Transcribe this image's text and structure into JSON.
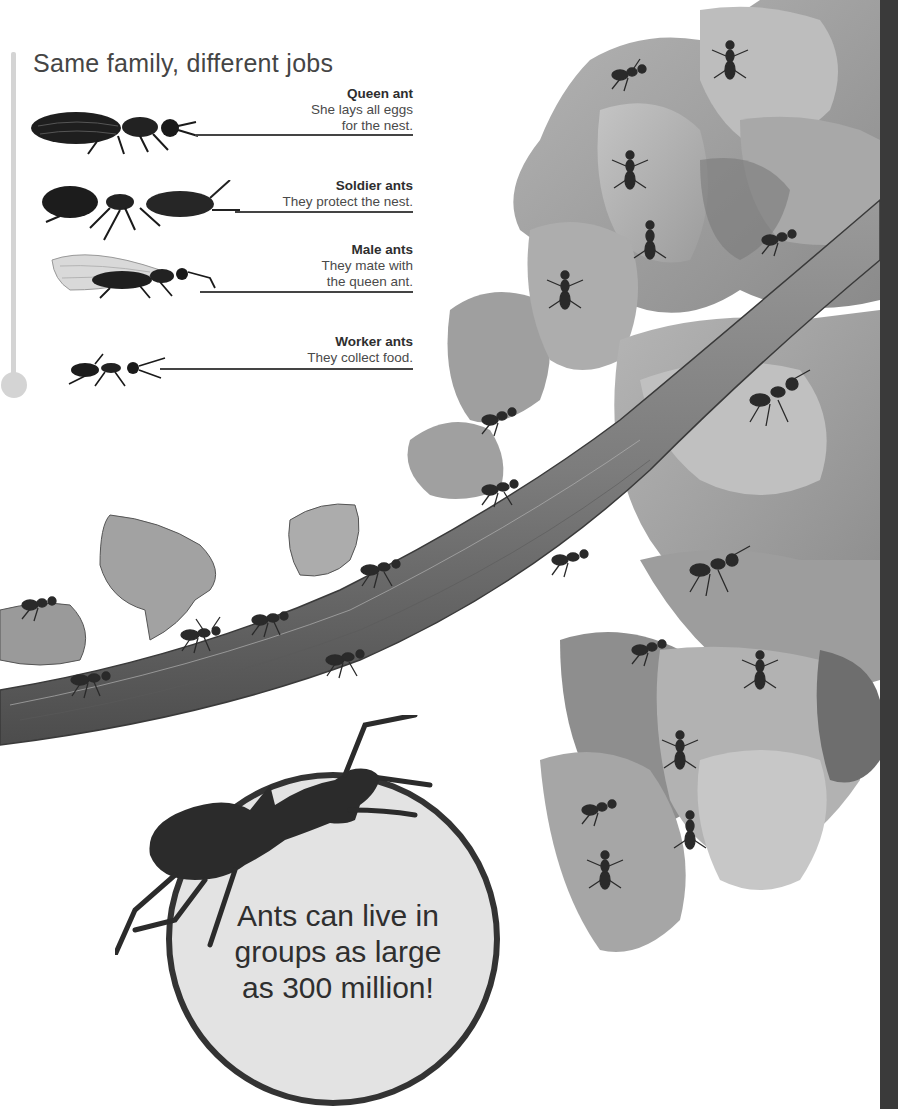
{
  "section": {
    "title": "Same family, different jobs"
  },
  "castes": [
    {
      "name": "Queen ant",
      "description": "She lays all eggs\nfor the nest.",
      "icon": "queen-ant-icon"
    },
    {
      "name": "Soldier ants",
      "description": "They protect the nest.",
      "icon": "soldier-ant-icon"
    },
    {
      "name": "Male ants",
      "description": "They mate with\nthe queen ant.",
      "icon": "winged-male-ant-icon"
    },
    {
      "name": "Worker ants",
      "description": "They collect food.",
      "icon": "worker-ant-icon"
    }
  ],
  "fact": {
    "text": "Ants can live in\ngroups as large\nas 300 million!"
  },
  "illustration": {
    "subject": "Leafcutter ants carrying leaf pieces along a branch",
    "style": "grayscale"
  },
  "colors": {
    "title": "#454545",
    "timeline": "#d4d4d4",
    "fact_circle_fill": "#e3e3e3",
    "fact_circle_border": "#333333",
    "page_strip": "#3a3a3a"
  }
}
